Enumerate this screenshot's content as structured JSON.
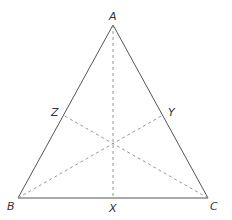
{
  "diagram": {
    "type": "triangle-medians",
    "colors": {
      "edge": "#555555",
      "median": "#8a8a8a",
      "label": "#333333",
      "background": "#ffffff"
    },
    "vertices": {
      "A": {
        "label": "A",
        "x": 113,
        "y": 25
      },
      "B": {
        "label": "B",
        "x": 18,
        "y": 198
      },
      "C": {
        "label": "C",
        "x": 208,
        "y": 198
      }
    },
    "midpoints": {
      "X": {
        "label": "X",
        "x": 113,
        "y": 198
      },
      "Y": {
        "label": "Y",
        "x": 163,
        "y": 115
      },
      "Z": {
        "label": "Z",
        "x": 63,
        "y": 115
      }
    },
    "centroid": {
      "x": 113,
      "y": 143
    },
    "edges": [
      [
        "A",
        "B"
      ],
      [
        "B",
        "C"
      ],
      [
        "C",
        "A"
      ]
    ],
    "medians": [
      [
        "A",
        "X"
      ],
      [
        "B",
        "Y"
      ],
      [
        "C",
        "Z"
      ]
    ]
  }
}
